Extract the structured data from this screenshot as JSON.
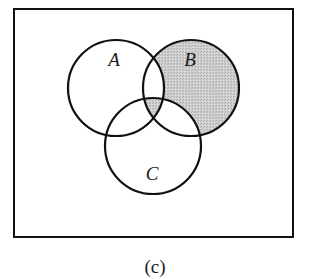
{
  "diagram": {
    "type": "venn",
    "universe_frame": {
      "x": 14,
      "y": 9,
      "width": 279,
      "height": 228
    },
    "sets": [
      {
        "id": "A",
        "label": "A",
        "cx": 116,
        "cy": 88,
        "r": 48,
        "label_x": 114,
        "label_y": 66
      },
      {
        "id": "B",
        "label": "B",
        "cx": 191,
        "cy": 88,
        "r": 48,
        "label_x": 190,
        "label_y": 66
      },
      {
        "id": "C",
        "label": "C",
        "cx": 153,
        "cy": 146,
        "r": 48,
        "label_x": 152,
        "label_y": 180
      }
    ],
    "shaded_regions": [
      "B only (B ∖ (A ∪ C))",
      "A ∩ B ∩ C"
    ],
    "shade_color": "#c6c6c6",
    "stroke_color": "#111111"
  },
  "caption": "(c)"
}
